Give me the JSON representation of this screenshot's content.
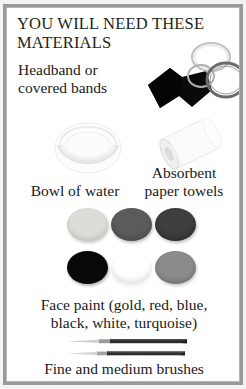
{
  "page": {
    "frame_border_color": "#9a9a9a",
    "background_color": "#ffffff",
    "text_color": "#1a1a1a"
  },
  "title": "YOU WILL NEED THESE\nMATERIALS",
  "items": [
    {
      "key": "headband",
      "label": "Headband or\ncovered bands",
      "icon": "headband-icon",
      "color": "#0a0a0a"
    },
    {
      "key": "bands",
      "label": "covered bands",
      "icon": "elastic-bands-icon",
      "ring_colors": [
        "#b9b9b9",
        "#a6a6a6",
        "#6e6e6e"
      ]
    },
    {
      "key": "bowl",
      "label": "Bowl of water",
      "icon": "bowl-of-water-icon",
      "color": "#f2f2f2"
    },
    {
      "key": "towels",
      "label": "Absorbent\npaper towels",
      "icon": "paper-towel-roll-icon",
      "color": "#fafafa"
    },
    {
      "key": "facepaint",
      "label": "Face paint (gold, red, blue,\nblack, white, turquoise)",
      "icon": "face-paint-discs-icon"
    },
    {
      "key": "brushes",
      "label": "Fine and medium brushes",
      "icon": "paint-brushes-icon"
    }
  ],
  "face_paint": {
    "caption": "Face paint (gold, red, blue,\nblack, white, turquoise)",
    "colors": [
      {
        "name": "gold",
        "swatch": "#dcdcd8"
      },
      {
        "name": "red",
        "swatch": "#5b5b5b"
      },
      {
        "name": "blue",
        "swatch": "#3e3e3e"
      },
      {
        "name": "black",
        "swatch": "#080808"
      },
      {
        "name": "white",
        "swatch": "#fdfdfd"
      },
      {
        "name": "turquoise",
        "swatch": "#8b8b8b"
      }
    ]
  },
  "brushes": {
    "caption": "Fine and medium brushes",
    "count": 2,
    "handle_color": "#2c2c2c",
    "bristle_color": "#c9c9c9"
  }
}
